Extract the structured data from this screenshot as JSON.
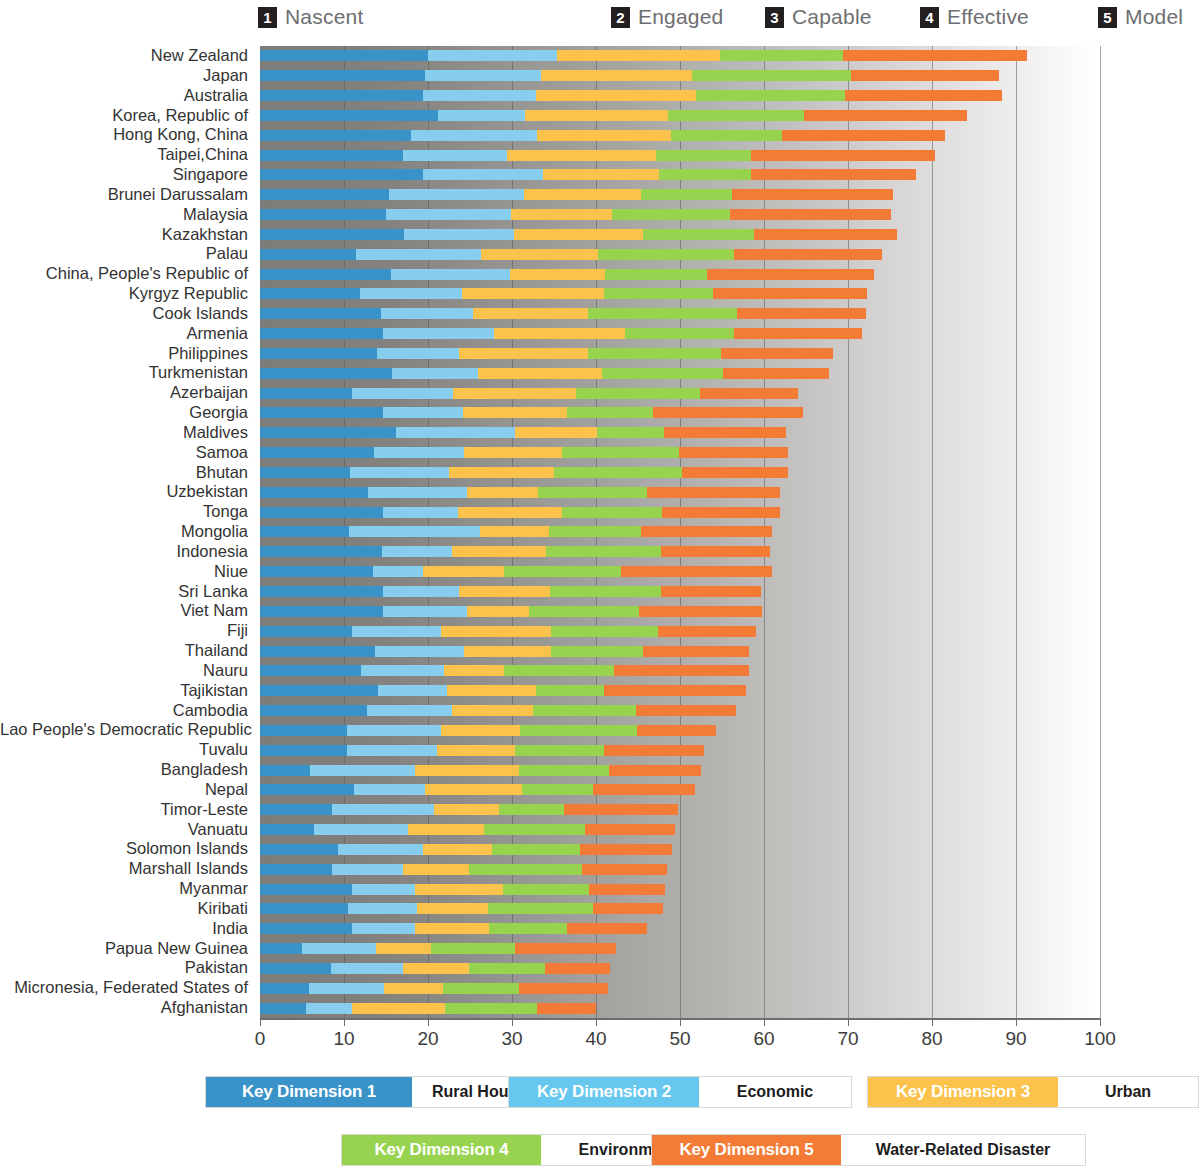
{
  "header": {
    "stages": [
      {
        "num": "1",
        "label": "Nascent"
      },
      {
        "num": "2",
        "label": "Engaged"
      },
      {
        "num": "3",
        "label": "Capable"
      },
      {
        "num": "4",
        "label": "Effective"
      },
      {
        "num": "5",
        "label": "Model"
      }
    ]
  },
  "legend": {
    "items": [
      {
        "key": "Key Dimension 1",
        "value": "Rural Household",
        "color": "#3993c8"
      },
      {
        "key": "Key Dimension 2",
        "value": "Economic",
        "color": "#66c7ef"
      },
      {
        "key": "Key Dimension 3",
        "value": "Urban",
        "color": "#fbc24c"
      },
      {
        "key": "Key Dimension 4",
        "value": "Environment",
        "color": "#97d34f"
      },
      {
        "key": "Key Dimension 5",
        "value": "Water-Related Disaster",
        "color": "#f47b35"
      }
    ]
  },
  "chart_data": {
    "type": "bar",
    "title": "",
    "xlabel": "",
    "ylabel": "",
    "orientation": "horizontal",
    "stacked": true,
    "xlim": [
      0,
      100
    ],
    "xticks": [
      0,
      10,
      20,
      30,
      40,
      50,
      60,
      70,
      80,
      90,
      100
    ],
    "grid": true,
    "legend_position": "bottom",
    "series": [
      {
        "name": "Key Dimension 1",
        "label": "Rural Household",
        "color": "#3993c8"
      },
      {
        "name": "Key Dimension 2",
        "label": "Economic",
        "color": "#87cdee"
      },
      {
        "name": "Key Dimension 3",
        "label": "Urban",
        "color": "#fbc24c"
      },
      {
        "name": "Key Dimension 4",
        "label": "Environment",
        "color": "#97d34f"
      },
      {
        "name": "Key Dimension 5",
        "label": "Water-Related Disaster",
        "color": "#f47b35"
      }
    ],
    "categories": [
      "New Zealand",
      "Japan",
      "Australia",
      "Korea, Republic of",
      "Hong Kong, China",
      "Taipei,China",
      "Singapore",
      "Brunei Darussalam",
      "Malaysia",
      "Kazakhstan",
      "Palau",
      "China, People's Republic of",
      "Kyrgyz Republic",
      "Cook Islands",
      "Armenia",
      "Philippines",
      "Turkmenistan",
      "Azerbaijan",
      "Georgia",
      "Maldives",
      "Samoa",
      "Bhutan",
      "Uzbekistan",
      "Tonga",
      "Mongolia",
      "Indonesia",
      "Niue",
      "Sri Lanka",
      "Viet Nam",
      "Fiji",
      "Thailand",
      "Nauru",
      "Tajikistan",
      "Cambodia",
      "Lao People's Democratic Republic",
      "Tuvalu",
      "Bangladesh",
      "Nepal",
      "Timor-Leste",
      "Vanuatu",
      "Solomon Islands",
      "Marshall Islands",
      "Myanmar",
      "Kiribati",
      "India",
      "Papua New Guinea",
      "Pakistan",
      "Micronesia, Federated States of",
      "Afghanistan"
    ],
    "values": [
      [
        20.0,
        15.4,
        19.4,
        14.6,
        21.9
      ],
      [
        19.6,
        13.8,
        18.0,
        19.0,
        17.6
      ],
      [
        19.4,
        13.5,
        19.0,
        17.7,
        18.7
      ],
      [
        21.2,
        10.3,
        17.1,
        16.2,
        19.4
      ],
      [
        18.0,
        15.0,
        15.9,
        13.3,
        19.4
      ],
      [
        17.0,
        12.4,
        17.8,
        11.2,
        22.0
      ],
      [
        19.4,
        14.3,
        13.8,
        10.9,
        19.7
      ],
      [
        15.4,
        16.0,
        14.0,
        10.8,
        19.2
      ],
      [
        15.0,
        14.9,
        12.0,
        14.0,
        19.2
      ],
      [
        17.2,
        13.0,
        15.4,
        13.2,
        17.0
      ],
      [
        11.4,
        14.9,
        13.9,
        16.2,
        17.6
      ],
      [
        15.6,
        14.2,
        11.3,
        12.1,
        19.9
      ],
      [
        11.9,
        12.2,
        16.9,
        12.9,
        18.4
      ],
      [
        14.4,
        11.0,
        13.6,
        17.8,
        15.3
      ],
      [
        14.6,
        13.2,
        15.6,
        13.0,
        15.3
      ],
      [
        13.9,
        9.8,
        15.4,
        15.8,
        13.3
      ],
      [
        15.7,
        10.2,
        14.8,
        14.4,
        12.6
      ],
      [
        10.9,
        12.1,
        14.6,
        14.8,
        11.6
      ],
      [
        14.6,
        9.6,
        12.4,
        10.2,
        17.8
      ],
      [
        16.2,
        14.1,
        9.8,
        8.0,
        14.5
      ],
      [
        13.6,
        10.7,
        11.6,
        14.0,
        13.0
      ],
      [
        10.7,
        11.8,
        12.5,
        15.2,
        12.7
      ],
      [
        12.8,
        11.8,
        8.5,
        13.0,
        15.8
      ],
      [
        14.6,
        9.0,
        12.3,
        12.0,
        14.0
      ],
      [
        10.6,
        15.6,
        8.2,
        11.0,
        15.5
      ],
      [
        14.5,
        8.3,
        11.3,
        13.6,
        13.0
      ],
      [
        13.4,
        6.0,
        9.6,
        14.0,
        18.0
      ],
      [
        14.6,
        9.1,
        10.8,
        13.2,
        12.0
      ],
      [
        14.6,
        10.0,
        7.4,
        13.1,
        14.7
      ],
      [
        10.9,
        10.7,
        13.0,
        12.8,
        11.6
      ],
      [
        13.7,
        10.6,
        10.3,
        11.0,
        12.6
      ],
      [
        12.0,
        9.9,
        7.2,
        13.1,
        16.0
      ],
      [
        14.1,
        8.2,
        10.6,
        8.0,
        16.9
      ],
      [
        12.7,
        10.1,
        9.7,
        12.3,
        11.9
      ],
      [
        10.4,
        11.1,
        9.4,
        14.0,
        9.4
      ],
      [
        10.4,
        10.7,
        9.2,
        10.7,
        11.9
      ],
      [
        6.0,
        12.4,
        12.4,
        10.7,
        11.0
      ],
      [
        11.2,
        8.4,
        11.6,
        8.4,
        12.2
      ],
      [
        8.6,
        12.1,
        7.7,
        7.8,
        13.6
      ],
      [
        6.4,
        11.2,
        9.1,
        12.0,
        10.7
      ],
      [
        9.3,
        10.1,
        8.2,
        10.5,
        11.0
      ],
      [
        8.6,
        8.4,
        7.9,
        13.4,
        10.2
      ],
      [
        11.0,
        7.4,
        10.5,
        10.3,
        9.0
      ],
      [
        10.5,
        8.2,
        8.4,
        12.6,
        8.3
      ],
      [
        11.0,
        7.5,
        8.8,
        9.2,
        9.6
      ],
      [
        5.0,
        8.8,
        6.6,
        10.0,
        12.0
      ],
      [
        8.5,
        8.5,
        7.9,
        9.0,
        7.8
      ],
      [
        5.8,
        9.0,
        7.0,
        9.0,
        10.6
      ],
      [
        5.5,
        5.5,
        11.0,
        11.0,
        7.0
      ]
    ]
  }
}
